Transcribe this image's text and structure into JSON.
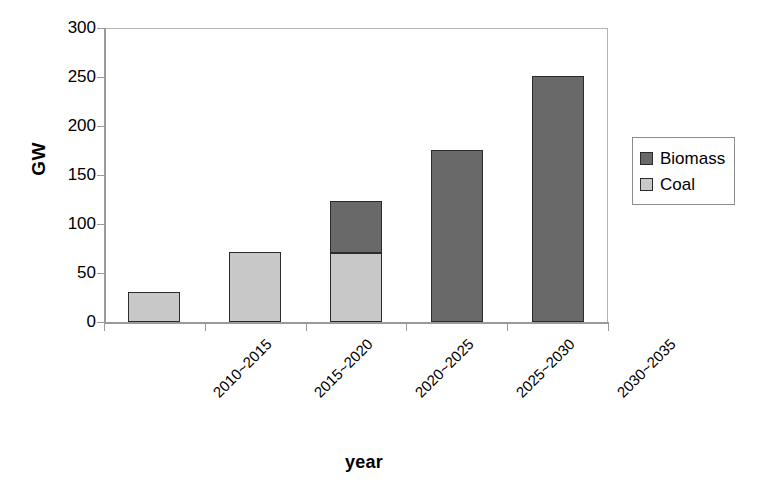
{
  "chart_data": {
    "type": "bar",
    "subtype": "stacked-bar",
    "title": "",
    "xlabel": "year",
    "ylabel": "GW",
    "categories": [
      "2010~2015",
      "2015~2020",
      "2020~2025",
      "2025~2030",
      "2030~2035"
    ],
    "series": [
      {
        "name": "Coal",
        "color": "#c8c8c8",
        "values": [
          31,
          71,
          70,
          0,
          0
        ]
      },
      {
        "name": "Biomass",
        "color": "#696969",
        "values": [
          0,
          0,
          53,
          176,
          251
        ]
      }
    ],
    "stack_order": [
      "Coal",
      "Biomass"
    ],
    "totals": [
      31,
      71,
      123,
      176,
      251
    ],
    "ylim": [
      0,
      300
    ],
    "yticks": [
      0,
      50,
      100,
      150,
      200,
      250,
      300
    ],
    "ytick_labels": [
      "0",
      "50",
      "100",
      "150",
      "200",
      "250",
      "300"
    ],
    "grid": false,
    "legend_position": "right",
    "legend_entries": [
      {
        "label": "Biomass",
        "color": "#696969"
      },
      {
        "label": "Coal",
        "color": "#c8c8c8"
      }
    ],
    "axis_color": "#9a9a9a",
    "bar_edge_color": "#2b2b2b",
    "background": "#ffffff"
  }
}
